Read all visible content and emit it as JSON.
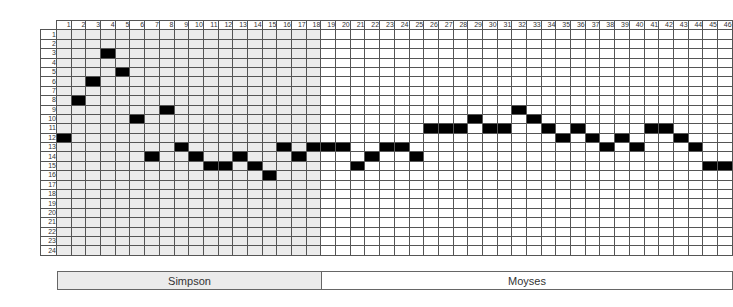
{
  "chart_data": {
    "type": "heatmap",
    "title": "",
    "columns": 46,
    "rows": 24,
    "column_labels": [
      1,
      2,
      3,
      4,
      5,
      6,
      7,
      8,
      9,
      10,
      11,
      12,
      13,
      14,
      15,
      16,
      17,
      18,
      19,
      20,
      21,
      22,
      23,
      24,
      25,
      26,
      27,
      28,
      29,
      30,
      31,
      32,
      33,
      34,
      35,
      36,
      37,
      38,
      39,
      40,
      41,
      42,
      43,
      44,
      45,
      46
    ],
    "row_labels": [
      1,
      2,
      3,
      4,
      5,
      6,
      7,
      8,
      9,
      10,
      11,
      12,
      13,
      14,
      15,
      16,
      17,
      18,
      19,
      20,
      21,
      22,
      23,
      24
    ],
    "filled_row_by_column": [
      12,
      8,
      6,
      3,
      5,
      10,
      14,
      9,
      13,
      14,
      15,
      15,
      14,
      15,
      16,
      13,
      14,
      13,
      13,
      13,
      15,
      14,
      13,
      13,
      14,
      11,
      11,
      11,
      10,
      11,
      11,
      9,
      10,
      11,
      12,
      11,
      12,
      13,
      12,
      13,
      11,
      11,
      12,
      13,
      15,
      15
    ],
    "groups": [
      {
        "name": "Simpson",
        "columns": [
          1,
          18
        ],
        "shade": "#ebebeb"
      },
      {
        "name": "Moyses",
        "columns": [
          19,
          46
        ],
        "shade": "#ffffff"
      }
    ]
  },
  "labels": {
    "simpson": "Simpson",
    "moyses": "Moyses"
  }
}
